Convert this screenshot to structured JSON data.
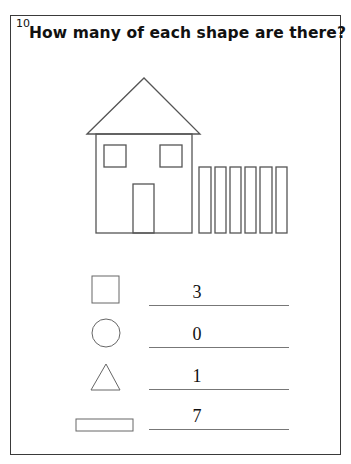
{
  "page": {
    "number": "10",
    "title": "How many of each shape are there?"
  },
  "picture": {
    "description": "house with fence",
    "windows": 2,
    "door": 1,
    "roof": "triangle",
    "fence_posts": 6
  },
  "questions": [
    {
      "shape": "square-icon",
      "answer": "3"
    },
    {
      "shape": "circle-icon",
      "answer": "0"
    },
    {
      "shape": "triangle-icon",
      "answer": "1"
    },
    {
      "shape": "rectangle-icon",
      "answer": "7"
    }
  ],
  "colors": {
    "stroke": "#555555",
    "text": "#111111",
    "border": "#3a3a3a"
  }
}
